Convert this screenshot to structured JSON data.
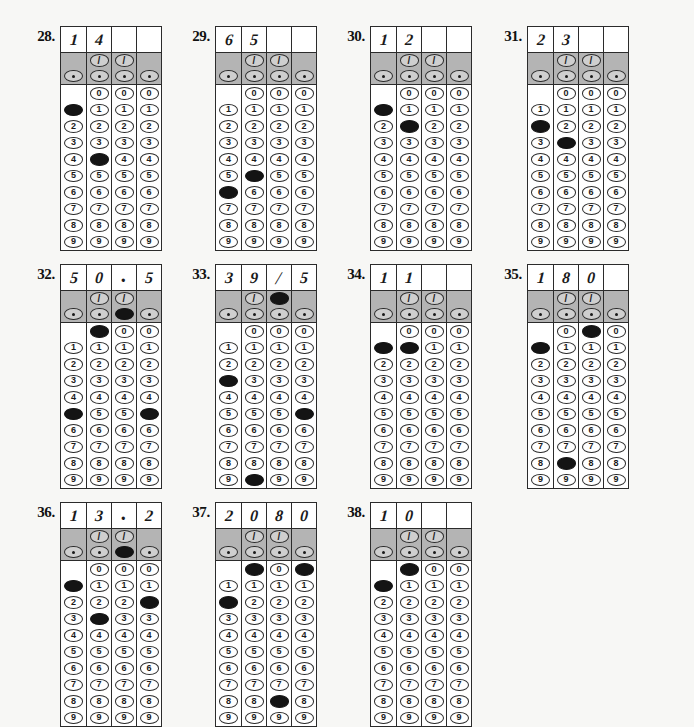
{
  "page": {
    "background_color": "#f7f7f5",
    "ink_color": "#1a1a1a",
    "shade_color": "#b4b4b4"
  },
  "grid_spec": {
    "columns": 4,
    "digits": [
      "0",
      "1",
      "2",
      "3",
      "4",
      "5",
      "6",
      "7",
      "8",
      "9"
    ],
    "slash_symbol": "/",
    "decimal_symbol": ".",
    "slash_available_columns": [
      1,
      2
    ],
    "decimal_available_columns": [
      0,
      1,
      2,
      3
    ],
    "zero_available_columns": [
      1,
      2,
      3
    ]
  },
  "items": [
    {
      "number": "28.",
      "written": [
        "1",
        "4",
        "",
        ""
      ],
      "marks": [
        {
          "col": 0,
          "value": "1"
        },
        {
          "col": 1,
          "value": "4"
        }
      ],
      "x": 28,
      "y": 26
    },
    {
      "number": "29.",
      "written": [
        "6",
        "5",
        "",
        ""
      ],
      "marks": [
        {
          "col": 0,
          "value": "6"
        },
        {
          "col": 1,
          "value": "5"
        }
      ],
      "x": 183,
      "y": 26
    },
    {
      "number": "30.",
      "written": [
        "1",
        "2",
        "",
        ""
      ],
      "marks": [
        {
          "col": 0,
          "value": "1"
        },
        {
          "col": 1,
          "value": "2"
        }
      ],
      "x": 338,
      "y": 26
    },
    {
      "number": "31.",
      "written": [
        "2",
        "3",
        "",
        ""
      ],
      "marks": [
        {
          "col": 0,
          "value": "2"
        },
        {
          "col": 1,
          "value": "3"
        }
      ],
      "x": 495,
      "y": 26
    },
    {
      "number": "32.",
      "written": [
        "5",
        "0",
        ".",
        "5"
      ],
      "marks": [
        {
          "col": 0,
          "value": "5"
        },
        {
          "col": 1,
          "value": "0"
        },
        {
          "col": 2,
          "value": "."
        },
        {
          "col": 3,
          "value": "5"
        }
      ],
      "x": 28,
      "y": 264
    },
    {
      "number": "33.",
      "written": [
        "3",
        "9",
        "/",
        "5"
      ],
      "marks": [
        {
          "col": 0,
          "value": "3"
        },
        {
          "col": 1,
          "value": "9"
        },
        {
          "col": 2,
          "value": "/"
        },
        {
          "col": 3,
          "value": "5"
        }
      ],
      "x": 183,
      "y": 264
    },
    {
      "number": "34.",
      "written": [
        "1",
        "1",
        "",
        ""
      ],
      "marks": [
        {
          "col": 0,
          "value": "1"
        },
        {
          "col": 1,
          "value": "1"
        }
      ],
      "x": 338,
      "y": 264
    },
    {
      "number": "35.",
      "written": [
        "1",
        "8",
        "0",
        ""
      ],
      "marks": [
        {
          "col": 0,
          "value": "1"
        },
        {
          "col": 1,
          "value": "8"
        },
        {
          "col": 2,
          "value": "0"
        }
      ],
      "x": 495,
      "y": 264
    },
    {
      "number": "36.",
      "written": [
        "1",
        "3",
        ".",
        "2"
      ],
      "marks": [
        {
          "col": 0,
          "value": "1"
        },
        {
          "col": 1,
          "value": "3"
        },
        {
          "col": 2,
          "value": "."
        },
        {
          "col": 3,
          "value": "2"
        }
      ],
      "x": 28,
      "y": 502
    },
    {
      "number": "37.",
      "written": [
        "2",
        "0",
        "8",
        "0"
      ],
      "marks": [
        {
          "col": 0,
          "value": "2"
        },
        {
          "col": 1,
          "value": "0"
        },
        {
          "col": 2,
          "value": "8"
        },
        {
          "col": 3,
          "value": "0"
        }
      ],
      "x": 183,
      "y": 502
    },
    {
      "number": "38.",
      "written": [
        "1",
        "0",
        "",
        ""
      ],
      "marks": [
        {
          "col": 0,
          "value": "1"
        },
        {
          "col": 1,
          "value": "0"
        }
      ],
      "x": 338,
      "y": 502
    }
  ]
}
